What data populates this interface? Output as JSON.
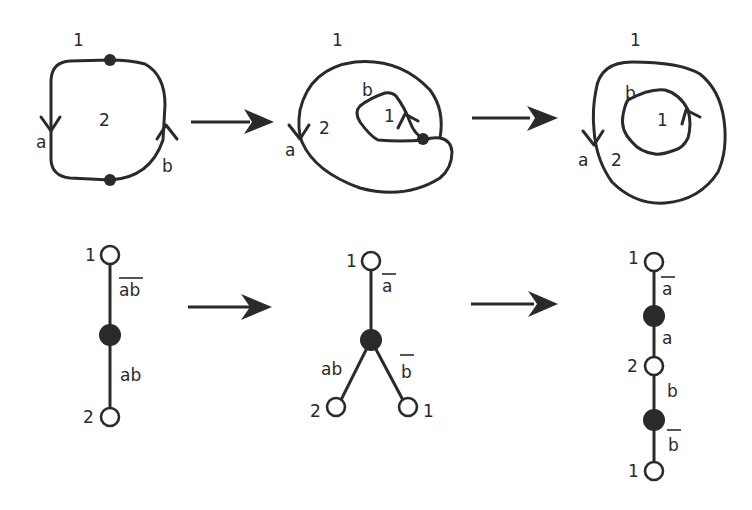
{
  "top_row": {
    "panel1": {
      "outer_label": "1",
      "inner_label": "2",
      "edge_a": "a",
      "edge_b": "b"
    },
    "panel2": {
      "outer_label": "1",
      "middle_label": "2",
      "inner_label": "1",
      "edge_a": "a",
      "edge_b": "b"
    },
    "panel3": {
      "outer_label": "1",
      "middle_label": "2",
      "inner_label": "1",
      "edge_a": "a",
      "edge_b": "b"
    }
  },
  "bottom_row": {
    "graph1": {
      "top_vertex": "1",
      "bottom_vertex": "2",
      "upper_edge": "ab",
      "upper_edge_overline": true,
      "lower_edge": "ab"
    },
    "graph2": {
      "top_vertex": "1",
      "left_vertex": "2",
      "right_vertex": "1",
      "top_edge": "a",
      "top_edge_overline": true,
      "left_edge": "ab",
      "right_edge": "b",
      "right_edge_overline": true
    },
    "graph3": {
      "vertex1": "1",
      "vertex2": "2",
      "vertex3": "1",
      "edge1": "a",
      "edge1_overline": true,
      "edge2": "a",
      "edge3": "b",
      "edge4": "b",
      "edge4_overline": true
    }
  },
  "colors": {
    "ink": "#2a2a2a",
    "background": "#ffffff"
  }
}
